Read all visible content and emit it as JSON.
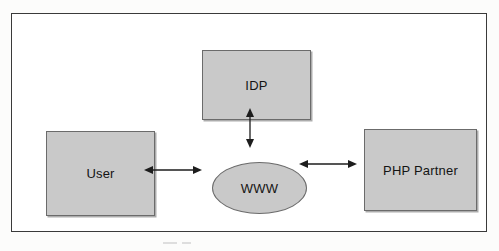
{
  "figure": {
    "type": "block-diagram",
    "title": "",
    "frame": {
      "border_color": "#3a3a3a",
      "background": "#ffffff"
    },
    "node_fill_color": "#c9c9c9",
    "node_border_color": "#6b6b6b",
    "connector_color": "#1d1d1d"
  },
  "nodes": [
    {
      "id": "idp",
      "label": "IDP",
      "shape": "rectangle"
    },
    {
      "id": "user",
      "label": "User",
      "shape": "rectangle"
    },
    {
      "id": "www",
      "label": "WWW",
      "shape": "ellipse"
    },
    {
      "id": "php_partner",
      "label": "PHP Partner",
      "shape": "rectangle"
    }
  ],
  "connectors": [
    {
      "id": "user-www",
      "from": "user",
      "to": "www",
      "style": "double-headed-arrow",
      "orientation": "horizontal",
      "label": ""
    },
    {
      "id": "www-php-partner",
      "from": "www",
      "to": "php_partner",
      "style": "double-headed-arrow",
      "orientation": "horizontal",
      "label": ""
    },
    {
      "id": "idp-www",
      "from": "idp",
      "to": "www",
      "style": "double-headed-arrow",
      "orientation": "vertical",
      "label": ""
    }
  ]
}
